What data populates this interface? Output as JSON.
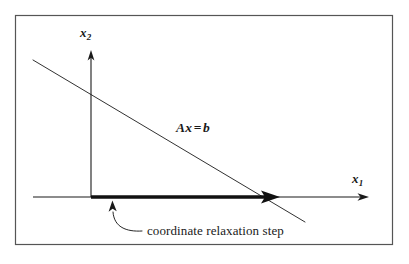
{
  "figure": {
    "background_color": "#ffffff",
    "border_color": "#4d4d4d",
    "ink_color": "#1a1a1a"
  },
  "axes": {
    "x_axis": {
      "label_base": "x",
      "label_sub": "1",
      "icon": "arrow-right-icon",
      "origin_x": 91,
      "origin_y": 197,
      "start_x": 33,
      "end_x": 368
    },
    "y_axis": {
      "label_base": "x",
      "label_sub": "2",
      "icon": "arrow-up-icon",
      "origin_x": 91,
      "origin_y": 197,
      "end_y": 52
    }
  },
  "constraint_line": {
    "label_lhs": "Ax",
    "label_op": "=",
    "label_rhs": "b",
    "x1": 33,
    "y1": 60,
    "x2": 305,
    "y2": 222
  },
  "step_arrow": {
    "name": "coordinate relaxation step",
    "from_x": 91,
    "from_y": 197,
    "to_x": 278,
    "to_y": 197,
    "thickness": 3
  },
  "annotation": {
    "caption": "coordinate relaxation step",
    "pointer_icon": "curved-arrow-icon",
    "pointer_tip_x": 113,
    "pointer_tip_y": 200,
    "pointer_tail_x": 140,
    "pointer_tail_y": 231
  }
}
